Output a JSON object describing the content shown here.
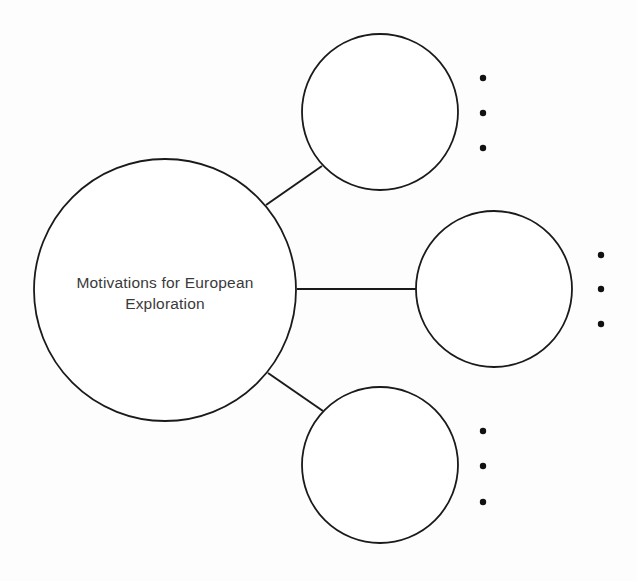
{
  "diagram": {
    "type": "bubble-map",
    "background": "#fdfdfd",
    "stroke_color": "#1a1a1a",
    "central_node": {
      "label_lines": [
        "Motivations for European",
        "Exploration"
      ]
    },
    "branches": [
      {
        "position": "top",
        "label": "",
        "bullets": [
          "",
          "",
          ""
        ]
      },
      {
        "position": "middle",
        "label": "",
        "bullets": [
          "",
          "",
          ""
        ]
      },
      {
        "position": "bottom",
        "label": "",
        "bullets": [
          "",
          "",
          ""
        ]
      }
    ]
  }
}
